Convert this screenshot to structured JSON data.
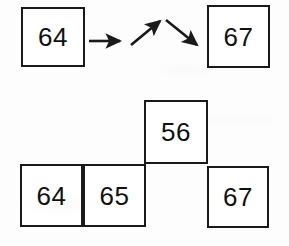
{
  "figure": {
    "type": "box-and-arrow-diagram",
    "background_color": "#fdfdfd",
    "stroke_color": "#1a1a1a",
    "fill_color": "#ffffff"
  },
  "top_row": {
    "name": "top-sequence",
    "boxes": [
      {
        "label": "64",
        "x": 21,
        "y": 7,
        "w": 64,
        "h": 60
      },
      {
        "label": "67",
        "x": 207,
        "y": 5,
        "w": 63,
        "h": 63
      }
    ],
    "arrows": [
      {
        "name": "arrow-right",
        "direction": "right",
        "x1": 89,
        "y1": 41,
        "x2": 122,
        "y2": 41
      },
      {
        "name": "arrow-up-right",
        "direction": "up-right",
        "x1": 131,
        "y1": 45,
        "x2": 162,
        "y2": 20
      },
      {
        "name": "arrow-down-right",
        "direction": "down-right",
        "x1": 166,
        "y1": 20,
        "x2": 199,
        "y2": 46
      }
    ]
  },
  "bottom_cluster": {
    "name": "tetromino-cluster",
    "boxes": [
      {
        "label": "56",
        "x": 144,
        "y": 100,
        "w": 64,
        "h": 64
      },
      {
        "label": "64",
        "x": 20,
        "y": 164,
        "w": 63,
        "h": 63
      },
      {
        "label": "65",
        "x": 83,
        "y": 164,
        "w": 63,
        "h": 63
      },
      {
        "label": "67",
        "x": 207,
        "y": 166,
        "w": 62,
        "h": 62
      }
    ]
  }
}
